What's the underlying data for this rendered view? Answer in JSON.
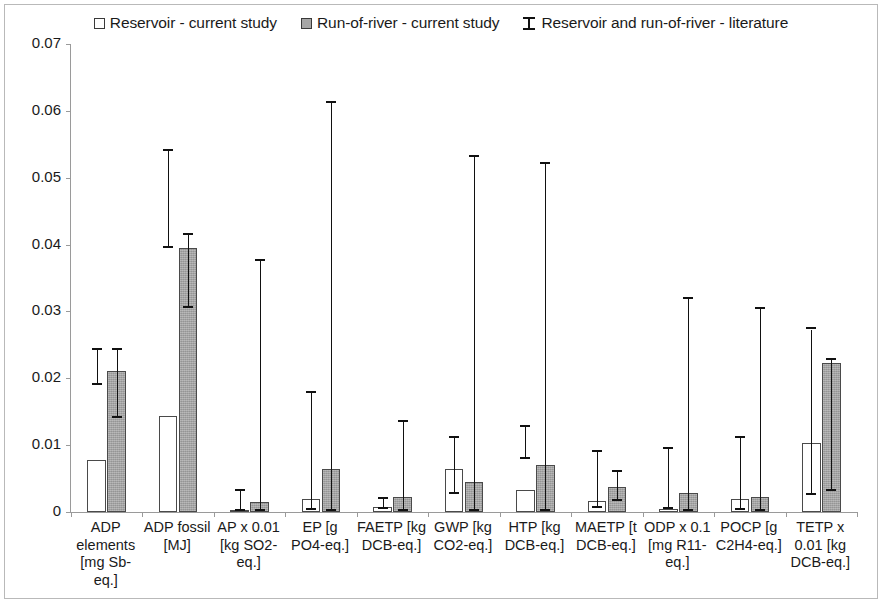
{
  "legend": {
    "items": [
      {
        "label": "Reservoir - current study",
        "marker": "white-square-icon"
      },
      {
        "label": "Run-of-river - current study",
        "marker": "gray-square-icon"
      },
      {
        "label": "Reservoir and run-of-river - literature",
        "marker": "error-bar-icon"
      }
    ]
  },
  "axis": {
    "y_ticks": [
      "0.07",
      "0.06",
      "0.05",
      "0.04",
      "0.03",
      "0.02",
      "0.01",
      "0"
    ]
  },
  "colors": {
    "reservoir_fill": "#ffffff",
    "runofriver_fill": "#a3a3a3",
    "bar_outline": "#4a4a4a",
    "error_bar": "#111111",
    "axis": "#9a9a9a",
    "frame": "#b9b9b9"
  },
  "chart_data": {
    "type": "bar",
    "title": "",
    "xlabel": "",
    "ylabel": "",
    "ylim": [
      0,
      0.07
    ],
    "ytick_step": 0.01,
    "grid": false,
    "legend_position": "top-center",
    "categories": [
      "ADP elements [mg Sb-eq.]",
      "ADP fossil [MJ]",
      "AP x 0.01 [kg SO2-eq.]",
      "EP [g PO4-eq.]",
      "FAETP [kg DCB-eq.]",
      "GWP [kg CO2-eq.]",
      "HTP [kg DCB-eq.]",
      "MAETP [t DCB-eq.]",
      "ODP x 0.1 [mg R11-eq.]",
      "POCP [g C2H4-eq.]",
      "TETP x 0.01 [kg DCB-eq.]"
    ],
    "series": [
      {
        "name": "Reservoir - current study",
        "values": [
          0.0078,
          0.0143,
          0.0003,
          0.002,
          0.0008,
          0.0065,
          0.0033,
          0.0017,
          0.0004,
          0.002,
          0.0103
        ],
        "error_low": [
          0.019,
          0.0395,
          0.0002,
          0.0003,
          0.0004,
          0.0027,
          0.0079,
          0.0006,
          0.0004,
          0.0003,
          0.0025
        ],
        "error_high": [
          0.0243,
          0.054,
          0.0031,
          0.0178,
          0.002,
          0.0111,
          0.0127,
          0.009,
          0.0095,
          0.011,
          0.0273
        ]
      },
      {
        "name": "Run-of-river - current study",
        "values": [
          0.0211,
          0.0395,
          0.0015,
          0.0064,
          0.0022,
          0.0045,
          0.007,
          0.0038,
          0.0028,
          0.0022,
          0.0223
        ],
        "error_low": [
          0.0141,
          0.0305,
          0.0001,
          0.0002,
          0.0002,
          0.0001,
          0.0001,
          0.0016,
          0.0001,
          0.0002,
          0.0032
        ],
        "error_high": [
          0.0243,
          0.0415,
          0.0375,
          0.0612,
          0.0135,
          0.0531,
          0.0521,
          0.006,
          0.0318,
          0.0303,
          0.0227
        ]
      }
    ]
  }
}
